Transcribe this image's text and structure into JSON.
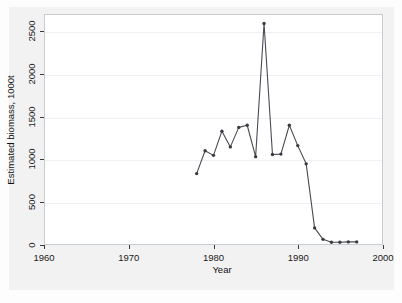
{
  "chart_data": {
    "type": "line",
    "title": "",
    "subtitle": "",
    "xlabel": "Year",
    "ylabel": "Estimated biomass, 1000t",
    "xlim": [
      1960,
      2000
    ],
    "ylim": [
      0,
      2700
    ],
    "xticks": [
      1960,
      1970,
      1980,
      1990,
      2000
    ],
    "xtick_labels": [
      "1960",
      "1970",
      "1980",
      "1990",
      "2000"
    ],
    "yticks": [
      0,
      500,
      1000,
      1500,
      2000,
      2500
    ],
    "ytick_labels": [
      "0",
      "500",
      "1000",
      "1500",
      "2000",
      "2500"
    ],
    "grid": true,
    "grid_axis": "y",
    "legend": "none",
    "marker": "filled-circle",
    "line_color": "#4a4a52",
    "marker_color": "#3a3a42",
    "x": [
      1978,
      1979,
      1980,
      1981,
      1982,
      1983,
      1984,
      1985,
      1986,
      1987,
      1988,
      1989,
      1990,
      1991,
      1992,
      1993,
      1994,
      1995,
      1996,
      1997
    ],
    "values": [
      830,
      1100,
      1045,
      1330,
      1145,
      1375,
      1400,
      1030,
      2600,
      1055,
      1060,
      1400,
      1160,
      945,
      190,
      55,
      20,
      20,
      25,
      25
    ],
    "series": [
      {
        "name": "Estimated biomass",
        "x": [
          1978,
          1979,
          1980,
          1981,
          1982,
          1983,
          1984,
          1985,
          1986,
          1987,
          1988,
          1989,
          1990,
          1991,
          1992,
          1993,
          1994,
          1995,
          1996,
          1997
        ],
        "values": [
          830,
          1100,
          1045,
          1330,
          1145,
          1375,
          1400,
          1030,
          2600,
          1055,
          1060,
          1400,
          1160,
          945,
          190,
          55,
          20,
          20,
          25,
          25
        ]
      }
    ],
    "annotations": []
  },
  "axes": {
    "y": {
      "label": "Estimated biomass, 1000t",
      "ticks": [
        {
          "value": 0,
          "label": "0"
        },
        {
          "value": 500,
          "label": "500"
        },
        {
          "value": 1000,
          "label": "1000"
        },
        {
          "value": 1500,
          "label": "1500"
        },
        {
          "value": 2000,
          "label": "2000"
        },
        {
          "value": 2500,
          "label": "2500"
        }
      ]
    },
    "x": {
      "label": "Year",
      "ticks": [
        {
          "value": 1960,
          "label": "1960"
        },
        {
          "value": 1970,
          "label": "1970"
        },
        {
          "value": 1980,
          "label": "1980"
        },
        {
          "value": 1990,
          "label": "1990"
        },
        {
          "value": 2000,
          "label": "2000"
        }
      ]
    }
  },
  "colors": {
    "page_background": "#fdfdfd",
    "figure_background": "#f2f2f2",
    "plot_background": "#ffffff",
    "frame": "#c8ccd0",
    "gridline": "#eef1f4",
    "series": "#4a4a52",
    "text": "#1a1a1a"
  }
}
